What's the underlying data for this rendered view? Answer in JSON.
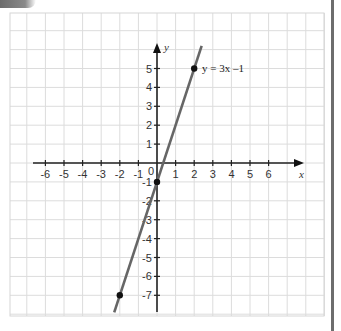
{
  "chart_data": {
    "type": "line",
    "title": "",
    "xlabel": "x",
    "ylabel": "y",
    "xlim": [
      -6.5,
      7.5
    ],
    "ylim": [
      -8,
      8
    ],
    "grid": true,
    "x_ticks": [
      -6,
      -5,
      -4,
      -3,
      -2,
      -1,
      0,
      1,
      2,
      3,
      4,
      5,
      6
    ],
    "y_ticks": [
      -7,
      -6,
      -5,
      -4,
      -3,
      -2,
      -1,
      1,
      2,
      3,
      4,
      5
    ],
    "series": [
      {
        "name": "y = 3x –1",
        "equation": "y = 3x - 1",
        "slope": 3,
        "intercept": -1,
        "x": [
          -2.3,
          2.4
        ],
        "y": [
          -7.9,
          6.2
        ],
        "color": "#666666"
      }
    ],
    "points": [
      {
        "x": 2,
        "y": 5
      },
      {
        "x": 0,
        "y": -1
      },
      {
        "x": -2,
        "y": -7
      }
    ],
    "annotations": [
      {
        "text": "y = 3x –1",
        "x": 2,
        "y": 5
      }
    ]
  },
  "labels": {
    "x_axis": "x",
    "y_axis": "y",
    "origin": "0",
    "equation": "y = 3x –1"
  }
}
